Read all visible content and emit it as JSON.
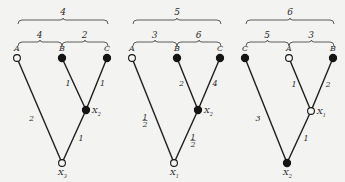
{
  "trees": [
    {
      "top_label": "4",
      "sub_labels": [
        "4",
        "2"
      ],
      "leaves": [
        {
          "name": "A",
          "filled": false
        },
        {
          "name": "B",
          "filled": true
        },
        {
          "name": "C",
          "filled": true
        }
      ],
      "inner": {
        "name": "X",
        "sub": "2",
        "filled": true
      },
      "root": {
        "name": "X",
        "sub": "3",
        "filled": false
      },
      "edge_labels": {
        "leaf0": "2",
        "leaf1": "1",
        "leaf2": "1",
        "inner": "1"
      }
    },
    {
      "top_label": "5",
      "sub_labels": [
        "3",
        "6"
      ],
      "leaves": [
        {
          "name": "A",
          "filled": false
        },
        {
          "name": "B",
          "filled": true
        },
        {
          "name": "C",
          "filled": true
        }
      ],
      "inner": {
        "name": "X",
        "sub": "2",
        "filled": true
      },
      "root": {
        "name": "X",
        "sub": "1",
        "filled": false
      },
      "edge_labels": {
        "leaf0": "1/2",
        "leaf1": "2",
        "leaf2": "4",
        "inner": "1/2"
      }
    },
    {
      "top_label": "6",
      "sub_labels": [
        "5",
        "3"
      ],
      "leaves": [
        {
          "name": "C",
          "filled": true
        },
        {
          "name": "A",
          "filled": false
        },
        {
          "name": "B",
          "filled": true
        }
      ],
      "inner": {
        "name": "X",
        "sub": "1",
        "filled": false
      },
      "root": {
        "name": "X",
        "sub": "2",
        "filled": true
      },
      "edge_labels": {
        "leaf0": "3",
        "leaf1": "1",
        "leaf2": "2",
        "inner": "1"
      }
    }
  ]
}
